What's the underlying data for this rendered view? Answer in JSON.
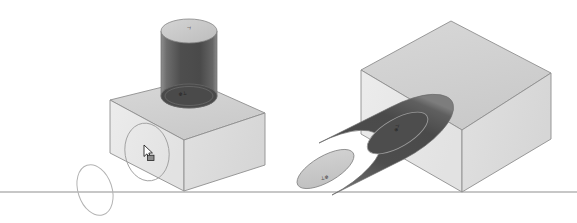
{
  "viewport": {
    "width": 577,
    "height": 223,
    "background": "#ffffff",
    "name": "3D CAD Viewport"
  },
  "palette": {
    "background": "#ffffff",
    "ground_line": "#b4b4b4",
    "box_top": "#d2d2d2",
    "box_front_left": "#e9e9e9",
    "box_front_right": "#dcdcdc",
    "box_edge": "#8a8a8a",
    "cylinder_body_dark": "#4f4f4f",
    "cylinder_body_mid": "#5c5c5c",
    "cylinder_body_light": "#9a9a9a",
    "cylinder_cap_light": "#c9c9c9",
    "cylinder_cap_dark": "#4a4a4a",
    "cylinder_edge": "#707070",
    "construction_ellipse": "#b0b0b0",
    "sketch_circle": "#9b9b9b",
    "cursor_fill": "#ffffff",
    "cursor_outline": "#1a1a1a",
    "annotation": "#181818"
  },
  "ground": {
    "label": "ground-line",
    "y": 192,
    "x_start": 0,
    "x_end": 577
  },
  "construction_ellipse": {
    "label": "construction-ellipse",
    "cx": 95,
    "cy": 190,
    "rx": 17,
    "ry": 26,
    "rotation_deg": -18
  },
  "objects": [
    {
      "id": "left-assembly",
      "label": "Left assembly",
      "parts": [
        {
          "id": "left-box",
          "label": "Box",
          "type": "box"
        },
        {
          "id": "left-cylinder",
          "label": "Vertical cylinder",
          "type": "cylinder",
          "orientation": "vertical"
        },
        {
          "id": "left-sketch-circle",
          "label": "Sketch circle on front face",
          "type": "circle"
        }
      ]
    },
    {
      "id": "right-assembly",
      "label": "Right assembly",
      "parts": [
        {
          "id": "right-box",
          "label": "Box",
          "type": "box"
        },
        {
          "id": "right-cylinder",
          "label": "Horizontal cylinder",
          "type": "cylinder",
          "orientation": "horizontal"
        }
      ]
    }
  ],
  "annotations": [
    {
      "id": "left-cyl-top-annotation",
      "text": "⊥",
      "x": 190,
      "y": 28,
      "rotation": -78
    },
    {
      "id": "left-cyl-base-annotation",
      "text": "⊕⊥",
      "x": 183,
      "y": 95,
      "rotation": -14
    },
    {
      "id": "right-cyl-cap-annotation",
      "text": "⊕⊥",
      "x": 398,
      "y": 128,
      "rotation": -72
    },
    {
      "id": "right-cyl-end-annotation",
      "text": "⊥⊕",
      "x": 325,
      "y": 179,
      "rotation": -14
    }
  ],
  "cursor": {
    "label": "mouse-cursor",
    "x": 146,
    "y": 148,
    "state": "select-arrow"
  }
}
